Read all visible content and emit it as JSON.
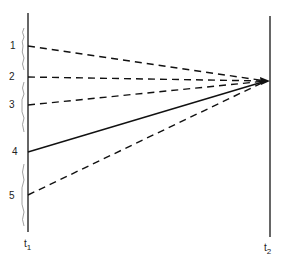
{
  "diagram": {
    "axes": [
      {
        "name": "t1",
        "label": "t",
        "sub": "1",
        "x": 28
      },
      {
        "name": "t2",
        "label": "t",
        "sub": "2",
        "x": 270
      }
    ],
    "convergence_point": {
      "x": 268,
      "y": 81
    },
    "points": [
      {
        "label": "1",
        "y": 46,
        "style": "dashed"
      },
      {
        "label": "2",
        "y": 77,
        "style": "dashed"
      },
      {
        "label": "3",
        "y": 105,
        "style": "dashed"
      },
      {
        "label": "4",
        "y": 152,
        "style": "solid"
      },
      {
        "label": "5",
        "y": 195,
        "style": "dashed"
      }
    ]
  }
}
